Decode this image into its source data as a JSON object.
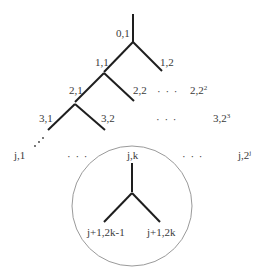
{
  "diagram": {
    "type": "binary-tree",
    "levels": [
      {
        "level": "0",
        "nodes": [
          "0,1"
        ]
      },
      {
        "level": "1",
        "nodes": [
          "1,1",
          "1,2"
        ]
      },
      {
        "level": "2",
        "nodes": [
          "2,1",
          "2,2",
          "...",
          "2,2",
          "2"
        ]
      },
      {
        "level": "3",
        "nodes": [
          "3,1",
          "3,2",
          "...",
          "3,2",
          "3"
        ]
      },
      {
        "level": "j",
        "nodes": [
          "j,1",
          "...",
          "j,k",
          "...",
          "j,2",
          "j"
        ]
      }
    ],
    "labels": {
      "n01": "0,1",
      "n11": "1,1",
      "n12": "1,2",
      "n21": "2,1",
      "n22": "2,2",
      "n2last_base": "2,2",
      "n2last_sup": "2",
      "n31": "3,1",
      "n32": "3,2",
      "n3last_base": "3,2",
      "n3last_sup": "3",
      "nj1": "j,1",
      "njk": "j,k",
      "njlast_base": "j,2",
      "njlast_sup": "j",
      "child_left": "j+1,2k-1",
      "child_right": "j+1,2k",
      "ellipsis": "· · ·"
    },
    "highlight": {
      "shape": "circle",
      "contains": [
        "j,k",
        "j+1,2k-1",
        "j+1,2k"
      ]
    },
    "colors": {
      "edge": "#1e1e1e",
      "text": "#3a3a3a",
      "circle": "#9a9a9a",
      "background": "#ffffff"
    }
  }
}
